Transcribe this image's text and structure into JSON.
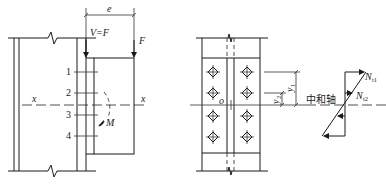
{
  "left_figure": {
    "dimension_label": "e",
    "shear_label": "V=F",
    "force_label": "F",
    "axis_label_left": "x",
    "axis_label_right": "x",
    "moment_label": "M",
    "bolt_rows": [
      "1",
      "2",
      "3",
      "4"
    ]
  },
  "right_figure": {
    "origin_label": "o",
    "y1_label": "y",
    "y1_sub": "1",
    "y2_label": "y",
    "y2_sub": "2",
    "neutral_axis_label": "中和轴",
    "n1_label": "N",
    "n1_sub": "t1",
    "n2_label": "N",
    "n2_sub": "t2"
  }
}
